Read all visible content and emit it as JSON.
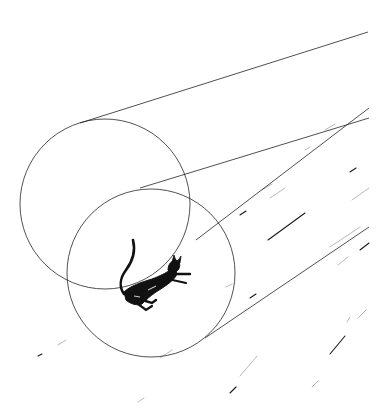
{
  "illustration": {
    "subject": "black cat falling through a tunnel of two circles",
    "background_color": "#ffffff",
    "ink_color": "#1a1a1a",
    "faint_ink_color": "#9a9a9a",
    "circles": [
      {
        "name": "rear-ring",
        "cx": 105,
        "cy": 204,
        "r": 85
      },
      {
        "name": "front-ring",
        "cx": 151,
        "cy": 273,
        "r": 84
      }
    ],
    "perspective_lines": [
      {
        "x1": 80,
        "y1": 123,
        "x2": 368,
        "y2": 32
      },
      {
        "x1": 140,
        "y1": 188,
        "x2": 369,
        "y2": 118
      },
      {
        "x1": 196,
        "y1": 240,
        "x2": 369,
        "y2": 108
      },
      {
        "x1": 205,
        "y1": 338,
        "x2": 369,
        "y2": 227
      }
    ],
    "speed_streaks": [
      {
        "x1": 268,
        "y1": 240,
        "x2": 305,
        "y2": 213
      },
      {
        "x1": 270,
        "y1": 198,
        "x2": 285,
        "y2": 188
      },
      {
        "x1": 352,
        "y1": 200,
        "x2": 369,
        "y2": 188
      },
      {
        "x1": 360,
        "y1": 250,
        "x2": 369,
        "y2": 243
      },
      {
        "x1": 330,
        "y1": 247,
        "x2": 360,
        "y2": 227
      },
      {
        "x1": 338,
        "y1": 265,
        "x2": 348,
        "y2": 257
      },
      {
        "x1": 330,
        "y1": 354,
        "x2": 345,
        "y2": 336
      },
      {
        "x1": 347,
        "y1": 322,
        "x2": 350,
        "y2": 317
      },
      {
        "x1": 240,
        "y1": 376,
        "x2": 257,
        "y2": 356
      },
      {
        "x1": 230,
        "y1": 393,
        "x2": 236,
        "y2": 387
      },
      {
        "x1": 312,
        "y1": 387,
        "x2": 318,
        "y2": 381
      },
      {
        "x1": 58,
        "y1": 345,
        "x2": 66,
        "y2": 340
      },
      {
        "x1": 38,
        "y1": 356,
        "x2": 42,
        "y2": 354
      },
      {
        "x1": 138,
        "y1": 402,
        "x2": 144,
        "y2": 398
      },
      {
        "x1": 160,
        "y1": 358,
        "x2": 172,
        "y2": 350
      },
      {
        "x1": 250,
        "y1": 298,
        "x2": 256,
        "y2": 294
      },
      {
        "x1": 226,
        "y1": 287,
        "x2": 232,
        "y2": 284
      },
      {
        "x1": 262,
        "y1": 190,
        "x2": 272,
        "y2": 184
      },
      {
        "x1": 240,
        "y1": 215,
        "x2": 246,
        "y2": 211
      },
      {
        "x1": 325,
        "y1": 130,
        "x2": 335,
        "y2": 124
      },
      {
        "x1": 305,
        "y1": 150,
        "x2": 310,
        "y2": 147
      },
      {
        "x1": 350,
        "y1": 172,
        "x2": 356,
        "y2": 168
      },
      {
        "x1": 358,
        "y1": 318,
        "x2": 366,
        "y2": 310
      }
    ]
  }
}
